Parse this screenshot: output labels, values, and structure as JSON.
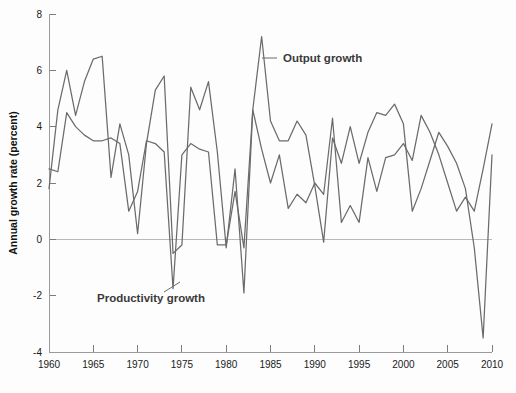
{
  "chart_data": {
    "type": "line",
    "title": "",
    "xlabel": "",
    "ylabel": "Annual growth rate (percent)",
    "xlim": [
      1960,
      2010
    ],
    "ylim": [
      -4,
      8
    ],
    "grid": false,
    "legend_position": "inline-annotations",
    "x_ticks": [
      1960,
      1965,
      1970,
      1975,
      1980,
      1985,
      1990,
      1995,
      2000,
      2005,
      2010
    ],
    "y_ticks": [
      -4,
      -2,
      0,
      2,
      4,
      6,
      8
    ],
    "x_tick_labels": [
      "1960",
      "1965",
      "1970",
      "1975",
      "1980",
      "1985",
      "1990",
      "1995",
      "2000",
      "2005",
      "2010"
    ],
    "y_tick_labels": [
      "-4",
      "-2",
      "0",
      "2",
      "4",
      "6",
      "8"
    ],
    "zero_line": 0,
    "x": [
      1960,
      1961,
      1962,
      1963,
      1964,
      1965,
      1966,
      1967,
      1968,
      1969,
      1970,
      1971,
      1972,
      1973,
      1974,
      1975,
      1976,
      1977,
      1978,
      1979,
      1980,
      1981,
      1982,
      1983,
      1984,
      1985,
      1986,
      1987,
      1988,
      1989,
      1990,
      1991,
      1992,
      1993,
      1994,
      1995,
      1996,
      1997,
      1998,
      1999,
      2000,
      2001,
      2002,
      2003,
      2004,
      2005,
      2006,
      2007,
      2008,
      2009,
      2010
    ],
    "series": [
      {
        "name": "Output growth",
        "color": "#6b6b6b",
        "values": [
          1.8,
          4.6,
          6.0,
          4.4,
          5.6,
          6.4,
          6.5,
          2.2,
          4.1,
          3.0,
          0.2,
          3.4,
          5.3,
          5.8,
          -0.5,
          -0.2,
          5.4,
          4.6,
          5.6,
          3.1,
          -0.3,
          2.5,
          -1.9,
          4.6,
          7.2,
          4.2,
          3.5,
          3.5,
          4.2,
          3.7,
          1.9,
          -0.1,
          3.6,
          2.7,
          4.0,
          2.7,
          3.8,
          4.5,
          4.4,
          4.8,
          4.1,
          1.0,
          1.8,
          2.8,
          3.8,
          3.3,
          2.7,
          1.8,
          -0.3,
          -3.5,
          3.0
        ]
      },
      {
        "name": "Productivity growth",
        "color": "#6b6b6b",
        "values": [
          2.5,
          2.4,
          4.5,
          4.0,
          3.7,
          3.5,
          3.5,
          3.6,
          3.4,
          1.0,
          1.7,
          3.5,
          3.4,
          3.1,
          -1.75,
          3.0,
          3.4,
          3.2,
          3.1,
          -0.2,
          -0.2,
          1.7,
          -0.3,
          4.6,
          3.2,
          2.0,
          3.0,
          1.1,
          1.6,
          1.3,
          2.0,
          1.6,
          4.3,
          0.6,
          1.2,
          0.6,
          2.9,
          1.7,
          2.9,
          3.0,
          3.4,
          2.8,
          4.4,
          3.8,
          3.0,
          2.0,
          1.0,
          1.5,
          1.0,
          2.5,
          4.1
        ]
      }
    ],
    "annotations": [
      {
        "text": "Output growth",
        "series": "Output growth",
        "points_to_year": 1984,
        "points_to_value": 6.7,
        "label_x": 283,
        "label_y": 62,
        "leader_x1": 262,
        "leader_y1": 58,
        "leader_x2": 277,
        "leader_y2": 58
      },
      {
        "text": "Productivity growth",
        "series": "Productivity growth",
        "points_to_year": 1974,
        "points_to_value": -1.75,
        "label_x": 97,
        "label_y": 302,
        "leader_x1": 180,
        "leader_y1": 282,
        "leader_x2": 164,
        "leader_y2": 292
      }
    ]
  },
  "plot_geometry": {
    "left": 49,
    "right": 492,
    "top": 14,
    "bottom": 352,
    "y_top_value": 8,
    "y_bottom_value": -4
  }
}
